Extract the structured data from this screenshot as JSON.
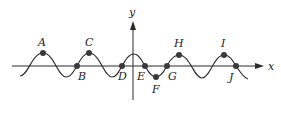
{
  "diagram": {
    "type": "sinusoidal-graph",
    "axes": {
      "x_label": "x",
      "y_label": "y"
    },
    "points": [
      {
        "label": "A",
        "x": 43,
        "y": 53,
        "lx": 43,
        "ly": 46,
        "role": "maximum"
      },
      {
        "label": "B",
        "x": 77,
        "y": 66,
        "lx": 81,
        "ly": 80,
        "role": "x-intercept"
      },
      {
        "label": "C",
        "x": 89,
        "y": 53,
        "lx": 89,
        "ly": 46,
        "role": "maximum"
      },
      {
        "label": "D",
        "x": 122,
        "y": 66,
        "lx": 125,
        "ly": 80,
        "role": "x-intercept"
      },
      {
        "label": "E",
        "x": 145,
        "y": 66,
        "lx": 141,
        "ly": 80,
        "role": "x-intercept"
      },
      {
        "label": "F",
        "x": 156,
        "y": 77,
        "lx": 155,
        "ly": 93,
        "role": "minimum"
      },
      {
        "label": "G",
        "x": 167,
        "y": 66,
        "lx": 171,
        "ly": 80,
        "role": "x-intercept"
      },
      {
        "label": "H",
        "x": 179,
        "y": 55,
        "lx": 179,
        "ly": 47,
        "role": "maximum"
      },
      {
        "label": "I",
        "x": 224,
        "y": 55,
        "lx": 224,
        "ly": 47,
        "role": "maximum"
      },
      {
        "label": "J",
        "x": 236,
        "y": 66,
        "lx": 232,
        "ly": 80,
        "role": "x-intercept"
      }
    ],
    "colors": {
      "line": "#2a2a2a",
      "point": "#3a3a3a",
      "background": "#ffffff"
    }
  }
}
